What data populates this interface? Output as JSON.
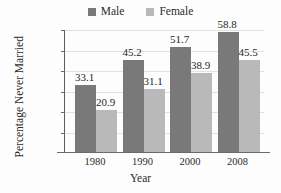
{
  "chart_data": {
    "type": "bar",
    "title": "",
    "xlabel": "Year",
    "ylabel": "Percentage Never Married",
    "categories": [
      "1980",
      "1990",
      "2000",
      "2008"
    ],
    "series": [
      {
        "name": "Male",
        "values": [
          33.1,
          45.2,
          51.7,
          58.8
        ],
        "color": "#797979"
      },
      {
        "name": "Female",
        "values": [
          20.9,
          31.1,
          38.9,
          45.5
        ],
        "color": "#b9b9b9"
      }
    ],
    "ylim": [
      0,
      60
    ],
    "ytick_labels": [
      "60%",
      "50%",
      "40%",
      "30%",
      "20%",
      "10%"
    ],
    "ytick_values": [
      60,
      50,
      40,
      30,
      20,
      10
    ],
    "grid": true,
    "legend_position": "top-center",
    "value_labels": [
      "33.1",
      "20.9",
      "45.2",
      "31.1",
      "51.7",
      "38.9",
      "58.8",
      "45.5"
    ]
  },
  "legend": {
    "entries": [
      {
        "label": "Male",
        "swatch": "male-swatch"
      },
      {
        "label": "Female",
        "swatch": "female-swatch"
      }
    ]
  },
  "axes": {
    "x_title": "Year",
    "y_title": "Percentage Never Married"
  }
}
